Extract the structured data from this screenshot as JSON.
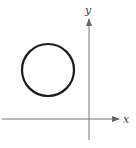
{
  "diagram": {
    "type": "coordinate-plane-with-circle",
    "axes": {
      "x_label": "x",
      "y_label": "y",
      "origin_px": [
        89,
        119
      ],
      "x_axis": {
        "from": [
          2,
          119
        ],
        "to": [
          119,
          119
        ]
      },
      "y_axis": {
        "from": [
          89,
          140
        ],
        "to": [
          89,
          18
        ]
      },
      "color": "#777777"
    },
    "circle": {
      "center_px": [
        48,
        70
      ],
      "radius_px": 26,
      "stroke": "#1a1a1a",
      "quadrant": "II"
    }
  }
}
